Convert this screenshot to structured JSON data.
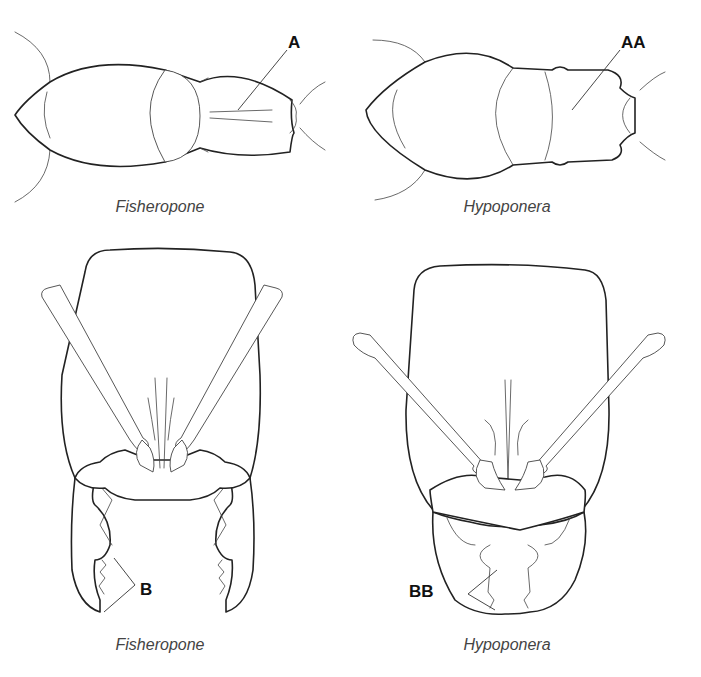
{
  "figure": {
    "panels": [
      {
        "id": "top-left",
        "view": "mesosoma-dorsal",
        "caption": "Fisheropone",
        "label": "A"
      },
      {
        "id": "top-right",
        "view": "mesosoma-dorsal",
        "caption": "Hypoponera",
        "label": "AA"
      },
      {
        "id": "bottom-left",
        "view": "head-full-face",
        "caption": "Fisheropone",
        "label": "B"
      },
      {
        "id": "bottom-right",
        "view": "head-full-face",
        "caption": "Hypoponera",
        "label": "BB"
      }
    ],
    "colors": {
      "line": "#222222",
      "caption": "#444444",
      "background": "#ffffff"
    }
  }
}
